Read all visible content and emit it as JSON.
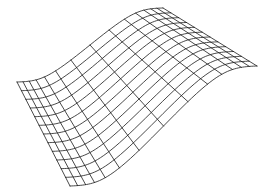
{
  "chart_data": {
    "type": "surface-wireframe",
    "title": "",
    "xlabel": "",
    "ylabel": "",
    "zlabel": "",
    "grid_rows": 12,
    "grid_cols": 14,
    "surface": "sigmoid step: z = 1 / (1 + exp(-k*(u - 0.5)))",
    "steepness_k": 12,
    "line_color": "#1a1a1a",
    "line_width": 0.8,
    "background": "#ffffff",
    "projection_corners": {
      "low_back": [
        17,
        82
      ],
      "low_front": [
        70,
        186
      ],
      "high_back": [
        163,
        8
      ],
      "high_front": [
        257,
        66
      ]
    },
    "axes_visible": false,
    "legend": []
  }
}
